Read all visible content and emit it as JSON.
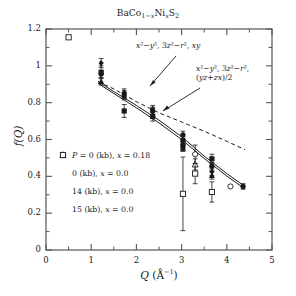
{
  "chart_data": {
    "type": "scatter",
    "xlabel": "Q (A^-1)",
    "ylabel": "f(Q)",
    "xlim": [
      0,
      5
    ],
    "ylim": [
      0,
      1.2
    ],
    "xticks": [
      "0",
      "1",
      "2",
      "3",
      "4",
      "5"
    ],
    "yticks": [
      "0",
      "0.2",
      "0.4",
      "0.6",
      "0.8",
      "1",
      "1.2"
    ],
    "xtick_values": [
      0,
      1,
      2,
      3,
      4,
      5
    ],
    "ytick_values": [
      0,
      0.2,
      0.4,
      0.6,
      0.8,
      1.0,
      1.2
    ],
    "grid": false,
    "legend_position": "lower-left-inside",
    "annotations": [
      {
        "id": "ann-upper",
        "text": "x²−y², 3z²−r², xy",
        "x": 2.55,
        "y": 1.06
      },
      {
        "id": "ann-lower-l1",
        "text": "x²−y², 3z²−r²,",
        "x": 3.55,
        "y": 0.92
      },
      {
        "id": "ann-lower-l2",
        "text": "(yz+zx)/2",
        "x": 3.55,
        "y": 0.855
      }
    ],
    "series": [
      {
        "name": "P = 0 (kb), x = 0.18",
        "marker": "filled-circle",
        "points": [
          {
            "x": 1.22,
            "y": 0.955,
            "yerr": 0.02
          },
          {
            "x": 1.73,
            "y": 0.845,
            "yerr": 0.02
          },
          {
            "x": 2.36,
            "y": 0.755,
            "yerr": 0.02
          },
          {
            "x": 3.03,
            "y": 0.625,
            "yerr": 0.02
          },
          {
            "x": 3.03,
            "y": 0.595,
            "yerr": 0.02
          },
          {
            "x": 3.67,
            "y": 0.455,
            "yerr": 0.02
          },
          {
            "x": 4.36,
            "y": 0.345,
            "yerr": 0.015
          }
        ]
      },
      {
        "name": "0 (kb), x = 0.0",
        "marker": "open-circle",
        "points": [
          {
            "x": 3.3,
            "y": 0.52,
            "yerr": 0.05
          },
          {
            "x": 4.08,
            "y": 0.345,
            "yerr": 0.0
          }
        ]
      },
      {
        "name": "0 (kb), x = 0.0",
        "marker": "filled-diamond",
        "points": [
          {
            "x": 1.22,
            "y": 1.015,
            "yerr": 0.025
          },
          {
            "x": 1.73,
            "y": 0.855,
            "yerr": 0.02
          },
          {
            "x": 2.36,
            "y": 0.765,
            "yerr": 0.02
          },
          {
            "x": 3.03,
            "y": 0.585,
            "yerr": 0.02
          },
          {
            "x": 3.67,
            "y": 0.425,
            "yerr": 0.02
          }
        ]
      },
      {
        "name": "14 (kb), x = 0.0",
        "marker": "filled-triangle",
        "points": [
          {
            "x": 1.22,
            "y": 0.915,
            "yerr": 0.02
          },
          {
            "x": 1.73,
            "y": 0.835,
            "yerr": 0.02
          },
          {
            "x": 2.36,
            "y": 0.735,
            "yerr": 0.02
          },
          {
            "x": 3.03,
            "y": 0.555,
            "yerr": 0.02
          },
          {
            "x": 3.67,
            "y": 0.405,
            "yerr": 0.02
          }
        ]
      },
      {
        "name": "14 (kb), x = 0.0",
        "marker": "open-triangle",
        "points": [
          {
            "x": 3.3,
            "y": 0.465,
            "yerr": 0.03
          }
        ]
      },
      {
        "name": "15 (kb), x = 0.0",
        "marker": "filled-square",
        "points": [
          {
            "x": 1.22,
            "y": 0.965,
            "yerr": 0.035
          },
          {
            "x": 1.73,
            "y": 0.755,
            "yerr": 0.035
          },
          {
            "x": 2.36,
            "y": 0.725,
            "yerr": 0.025
          },
          {
            "x": 3.03,
            "y": 0.565,
            "yerr": 0.025
          },
          {
            "x": 3.67,
            "y": 0.495,
            "yerr": 0.025
          }
        ]
      },
      {
        "name": "15 (kb), x = 0.0",
        "marker": "open-square",
        "points": [
          {
            "x": 3.03,
            "y": 0.305,
            "yerr": 0.2
          },
          {
            "x": 3.3,
            "y": 0.415,
            "yerr": 0.055
          },
          {
            "x": 3.67,
            "y": 0.315,
            "yerr": 0.055
          },
          {
            "x": 0.5,
            "y": 1.155,
            "yerr": 0.0
          }
        ]
      }
    ],
    "curves": [
      {
        "id": "curve-dashed",
        "style": "dashed",
        "label": "x²−y², 3z²−r², xy",
        "points": [
          [
            1.15,
            0.915
          ],
          [
            1.5,
            0.875
          ],
          [
            2.0,
            0.805
          ],
          [
            2.5,
            0.745
          ],
          [
            3.0,
            0.695
          ],
          [
            3.5,
            0.645
          ],
          [
            4.0,
            0.59
          ],
          [
            4.4,
            0.545
          ]
        ]
      },
      {
        "id": "curve-solid-a",
        "style": "solid",
        "label": "x²−y², 3z²−r², (yz+zx)/2",
        "points": [
          [
            1.15,
            0.915
          ],
          [
            1.5,
            0.86
          ],
          [
            2.0,
            0.785
          ],
          [
            2.5,
            0.705
          ],
          [
            3.0,
            0.615
          ],
          [
            3.5,
            0.51
          ],
          [
            4.0,
            0.415
          ],
          [
            4.4,
            0.345
          ]
        ]
      },
      {
        "id": "curve-solid-b",
        "style": "solid",
        "label": "x²−y², 3z²−r², (yz+zx)/2",
        "points": [
          [
            1.15,
            0.905
          ],
          [
            1.5,
            0.85
          ],
          [
            2.0,
            0.772
          ],
          [
            2.5,
            0.69
          ],
          [
            3.0,
            0.6
          ],
          [
            3.5,
            0.497
          ],
          [
            4.0,
            0.402
          ],
          [
            4.4,
            0.332
          ]
        ]
      }
    ]
  },
  "title": {
    "text": "BaCo1-xNixS2"
  },
  "axes": {
    "x": {
      "label_main": "Q",
      "label_unit": "(Å",
      "label_exp": "−1",
      "label_close": ")"
    },
    "y": {
      "label_f": "f",
      "label_open": "(",
      "label_q": "Q",
      "label_close": ")"
    }
  },
  "legend": {
    "items": [
      {
        "marker": "filled-circle",
        "label_p": "P",
        "label": "= 0 (kb),",
        "label_x": "x",
        "label_val": "= 0.18"
      },
      {
        "marker": "open-circle",
        "label_p": "",
        "label": "",
        "label_x": "",
        "label_val": ""
      },
      {
        "marker": "filled-diamond",
        "label_p": "",
        "label": "0 (kb),",
        "label_x": "x",
        "label_val": "= 0.0"
      },
      {
        "marker": "open-circle-sm",
        "label_p": "",
        "label": "",
        "label_x": "",
        "label_val": ""
      },
      {
        "marker": "filled-triangle",
        "label_p": "",
        "label": "14 (kb),",
        "label_x": "x",
        "label_val": "= 0.0"
      },
      {
        "marker": "open-triangle",
        "label_p": "",
        "label": "",
        "label_x": "",
        "label_val": ""
      },
      {
        "marker": "filled-square",
        "label_p": "",
        "label": "15 (kb),",
        "label_x": "x",
        "label_val": "= 0.0"
      },
      {
        "marker": "open-square",
        "label_p": "",
        "label": "",
        "label_x": "",
        "label_val": ""
      }
    ]
  },
  "colors": {
    "ink": "#1a1a1a",
    "axis": "#555555",
    "bg": "#ffffff"
  }
}
